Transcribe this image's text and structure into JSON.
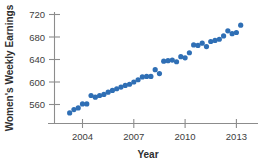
{
  "chart_data": {
    "type": "scatter",
    "title": "",
    "xlabel": "Year",
    "ylabel": "Women's Weekly Earnings",
    "xlim": [
      2003.0,
      2013.6
    ],
    "ylim": [
      532,
      728
    ],
    "grid": false,
    "legend": null,
    "marker_color": "#2f6fb5",
    "marker_size": 2.6,
    "xticks": [
      2004,
      2007,
      2010,
      2013
    ],
    "xtick_labels": [
      "2004",
      "2007",
      "2010",
      "2013"
    ],
    "yticks": [
      560,
      600,
      640,
      680,
      720
    ],
    "ytick_labels": [
      "560",
      "600",
      "640",
      "680",
      "720"
    ],
    "x": [
      2003.25,
      2003.5,
      2003.75,
      2004.0,
      2004.25,
      2004.5,
      2004.75,
      2005.0,
      2005.25,
      2005.5,
      2005.75,
      2006.0,
      2006.25,
      2006.5,
      2006.75,
      2007.0,
      2007.25,
      2007.5,
      2007.75,
      2008.0,
      2008.25,
      2008.5,
      2008.75,
      2009.0,
      2009.25,
      2009.5,
      2009.75,
      2010.0,
      2010.25,
      2010.5,
      2010.75,
      2011.0,
      2011.25,
      2011.5,
      2011.75,
      2012.0,
      2012.25,
      2012.5,
      2012.75,
      2013.0,
      2013.25
    ],
    "y": [
      545,
      551,
      554,
      561,
      561,
      576,
      573,
      576,
      578,
      582,
      585,
      588,
      591,
      594,
      596,
      600,
      604,
      609,
      610,
      610,
      622,
      615,
      637,
      638,
      639,
      636,
      645,
      643,
      652,
      666,
      665,
      669,
      663,
      672,
      674,
      676,
      682,
      691,
      686,
      688,
      701
    ],
    "series_name": "Women's weekly earnings (quarterly)",
    "units": "US dollars per week",
    "n_points": 41
  },
  "axes": {
    "y_title": "Women's Weekly Earnings",
    "x_title": "Year"
  }
}
